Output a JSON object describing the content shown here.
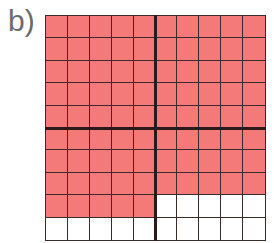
{
  "label": "b)",
  "grid": {
    "rows": 10,
    "cols": 10,
    "shaded_color": "#f47a7a",
    "unshaded_color": "#ffffff",
    "line_color": "#3a2a2a",
    "shaded_count": 85,
    "total_count": 100,
    "shaded_rows": [
      [
        1,
        1,
        1,
        1,
        1,
        1,
        1,
        1,
        1,
        1
      ],
      [
        1,
        1,
        1,
        1,
        1,
        1,
        1,
        1,
        1,
        1
      ],
      [
        1,
        1,
        1,
        1,
        1,
        1,
        1,
        1,
        1,
        1
      ],
      [
        1,
        1,
        1,
        1,
        1,
        1,
        1,
        1,
        1,
        1
      ],
      [
        1,
        1,
        1,
        1,
        1,
        1,
        1,
        1,
        1,
        1
      ],
      [
        1,
        1,
        1,
        1,
        1,
        1,
        1,
        1,
        1,
        1
      ],
      [
        1,
        1,
        1,
        1,
        1,
        1,
        1,
        1,
        1,
        1
      ],
      [
        1,
        1,
        1,
        1,
        1,
        1,
        1,
        1,
        1,
        1
      ],
      [
        1,
        1,
        1,
        1,
        1,
        0,
        0,
        0,
        0,
        0
      ],
      [
        0,
        0,
        0,
        0,
        0,
        0,
        0,
        0,
        0,
        0
      ]
    ]
  }
}
